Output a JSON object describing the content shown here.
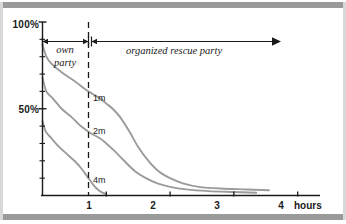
{
  "figure": {
    "background_color": "#ffffff",
    "frame_bar_color": "#9a9a9a",
    "curve_color": "#9b9b9b",
    "axis_color": "#1a1a1a"
  },
  "chart_data": {
    "type": "line",
    "title": "",
    "subtitle": "",
    "xlabel": "hours",
    "ylabel": "",
    "xlim": [
      0,
      4.35
    ],
    "ylim": [
      0,
      100
    ],
    "grid": false,
    "legend_position": "inline-curve-labels",
    "x_ticks": [
      1,
      2,
      3,
      4
    ],
    "x_tick_labels": [
      "1",
      "2",
      "3",
      "4"
    ],
    "x_units_label": "hours",
    "y_ticks": [
      50,
      100
    ],
    "y_tick_labels": [
      "50%",
      "100%"
    ],
    "y_minor_ticks": [
      10,
      20,
      30,
      40,
      60,
      70,
      80,
      90
    ],
    "series": [
      {
        "name": "1m",
        "label": "1m",
        "label_x": 1.06,
        "label_y": 55,
        "color": "#9b9b9b",
        "x": [
          0.0,
          0.06,
          0.14,
          0.3,
          0.5,
          0.72,
          0.9,
          1.0,
          1.1,
          1.22,
          1.36,
          1.5,
          1.66,
          1.82,
          2.0,
          2.2,
          2.45,
          2.8,
          3.2,
          3.55
        ],
        "y": [
          87,
          80,
          76,
          71,
          66,
          60,
          56,
          53,
          50,
          45,
          37,
          28,
          20,
          14,
          10,
          7,
          5,
          4,
          3.5,
          3
        ]
      },
      {
        "name": "2m",
        "label": "2m",
        "label_x": 1.06,
        "label_y": 33,
        "color": "#9b9b9b",
        "x": [
          0.0,
          0.06,
          0.16,
          0.3,
          0.46,
          0.6,
          0.75,
          0.9,
          1.0,
          1.12,
          1.28,
          1.45,
          1.62,
          1.8,
          2.0,
          2.25,
          2.6,
          3.0,
          3.35
        ],
        "y": [
          68,
          60,
          56,
          50,
          45,
          40,
          36,
          33,
          30,
          26,
          20,
          14,
          10,
          7,
          5,
          3.5,
          2.5,
          2,
          1.6
        ]
      },
      {
        "name": "4m",
        "label": "4m",
        "label_x": 1.06,
        "label_y": 9,
        "color": "#9b9b9b",
        "x": [
          0.0,
          0.05,
          0.14,
          0.26,
          0.38,
          0.5,
          0.6,
          0.7,
          0.8,
          0.88,
          0.95,
          1.0
        ],
        "y": [
          43,
          37,
          33,
          28,
          24,
          20,
          16,
          11,
          6,
          3,
          1.5,
          0.8
        ]
      }
    ],
    "annotations": [
      {
        "name": "own-party-span",
        "text": "own party",
        "text_lines": [
          "own",
          "party"
        ],
        "x_start": 0,
        "x_end": 1.0,
        "arrow_style": "double-headed-bar"
      },
      {
        "name": "organized-rescue-party-span",
        "text": "organized rescue party",
        "text_lines": [
          "organized rescue party"
        ],
        "x_start": 1.0,
        "x_end": 4.25,
        "arrow_style": "bar-to-arrowhead"
      },
      {
        "name": "one-hour-divider",
        "text": "",
        "x": 1.0,
        "style": "dashed-vertical"
      }
    ]
  }
}
